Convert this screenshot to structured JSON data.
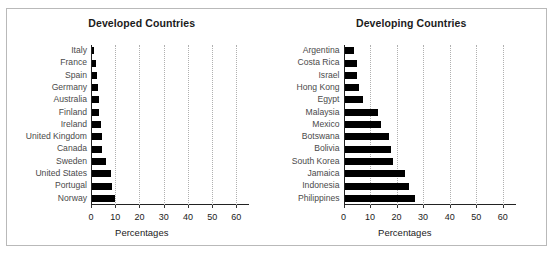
{
  "figure": {
    "border_color": "#b9b9b9",
    "background": "#ffffff",
    "bar_color": "#000000",
    "grid_color": "#b0b0b0"
  },
  "chart_data": [
    {
      "type": "bar",
      "orientation": "horizontal",
      "title": "Developed Countries",
      "xlabel": "Percentages",
      "ylabel": "",
      "xlim": [
        0,
        65
      ],
      "xticks": [
        0,
        10,
        20,
        30,
        40,
        50,
        60
      ],
      "xtick_labels": [
        "0",
        "10",
        "20",
        "30",
        "40",
        "50",
        "60"
      ],
      "grid": true,
      "legend": "none",
      "categories": [
        "Italy",
        "France",
        "Spain",
        "Germany",
        "Australia",
        "Finland",
        "Ireland",
        "United Kingdom",
        "Canada",
        "Sweden",
        "United States",
        "Portugal",
        "Norway"
      ],
      "values": [
        1.0,
        1.5,
        2.0,
        2.6,
        2.7,
        3.0,
        3.6,
        4.2,
        4.3,
        5.7,
        7.7,
        8.2,
        9.5
      ]
    },
    {
      "type": "bar",
      "orientation": "horizontal",
      "title": "Developing Countries",
      "xlabel": "Percentages",
      "ylabel": "",
      "xlim": [
        0,
        65
      ],
      "xticks": [
        0,
        10,
        20,
        30,
        40,
        50,
        60
      ],
      "xtick_labels": [
        "0",
        "10",
        "20",
        "30",
        "40",
        "50",
        "60"
      ],
      "grid": true,
      "legend": "none",
      "categories": [
        "Argentina",
        "Costa Rica",
        "Israel",
        "Hong Kong",
        "Egypt",
        "Malaysia",
        "Mexico",
        "Botswana",
        "Bolivia",
        "South Korea",
        "Jamaica",
        "Indonesia",
        "Philippines"
      ],
      "values": [
        3.5,
        4.6,
        4.7,
        5.5,
        6.8,
        12.5,
        13.8,
        16.8,
        17.6,
        18.2,
        22.8,
        24.2,
        26.6
      ]
    }
  ]
}
